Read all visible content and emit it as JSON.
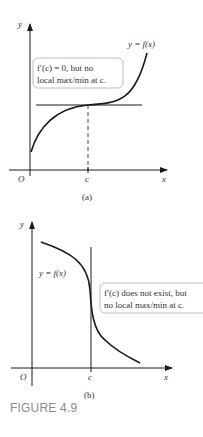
{
  "figure": {
    "caption": "FIGURE 4.9",
    "panels": [
      {
        "id": "a",
        "sublabel": "(a)",
        "axis_y_label": "y",
        "axis_x_label": "x",
        "origin_label": "O",
        "c_label": "c",
        "curve_label": "y = f(x)",
        "callout_line1": "f′(c) = 0, but no",
        "callout_line2": "local max/min at c."
      },
      {
        "id": "b",
        "sublabel": "(b)",
        "axis_y_label": "y",
        "axis_x_label": "x",
        "origin_label": "O",
        "c_label": "c",
        "curve_label": "y = f(x)",
        "callout_line1": "f′(c) does not exist, but",
        "callout_line2": "no local max/min at c."
      }
    ]
  },
  "colors": {
    "line": "#1a1a1a",
    "text": "#333333",
    "caption": "#8a8a8a",
    "callout_border": "#bdbdbd"
  }
}
